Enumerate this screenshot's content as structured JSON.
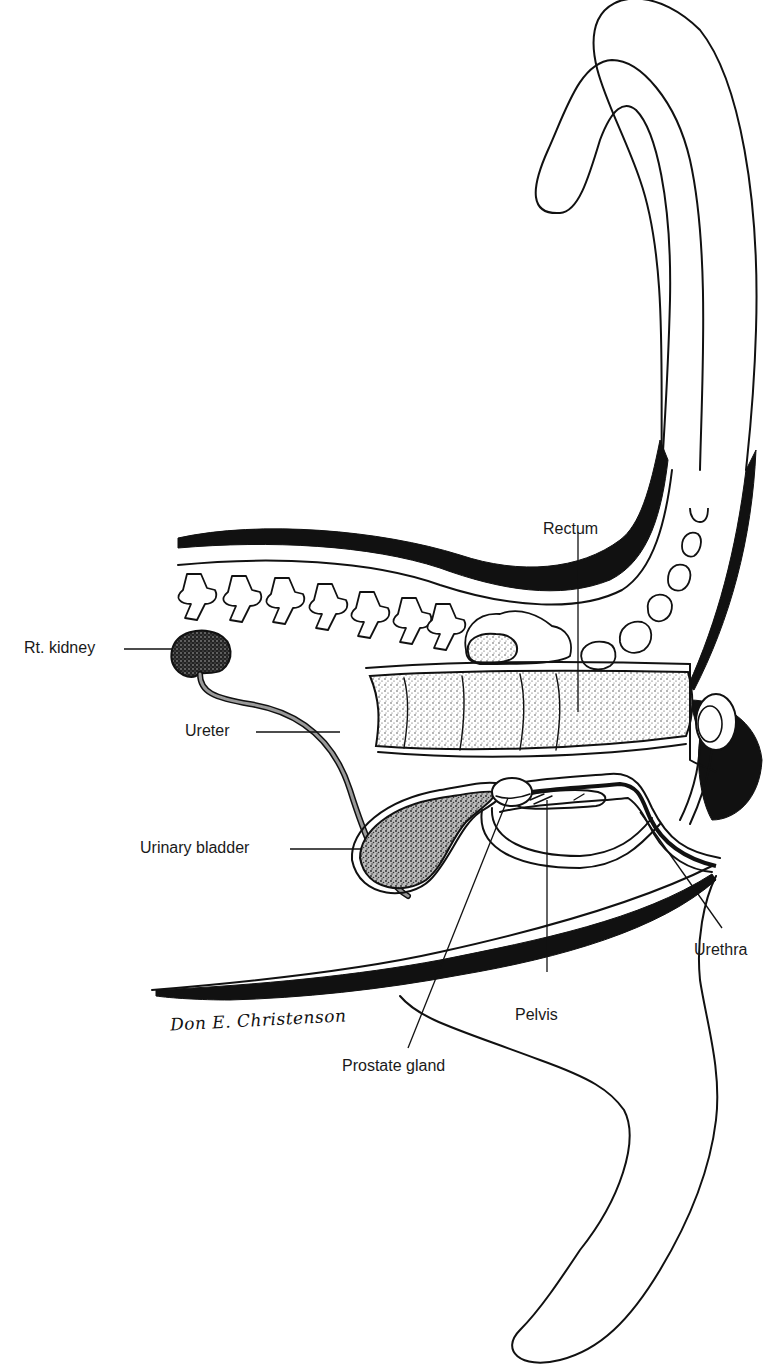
{
  "diagram": {
    "labels": {
      "rectum": "Rectum",
      "rt_kidney": "Rt. kidney",
      "ureter": "Ureter",
      "urinary_bladder": "Urinary bladder",
      "urethra": "Urethra",
      "pelvis": "Pelvis",
      "prostate_gland": "Prostate gland"
    },
    "signature": "Don E. Christenson",
    "colors": {
      "ink": "#111111",
      "background": "#ffffff"
    }
  }
}
